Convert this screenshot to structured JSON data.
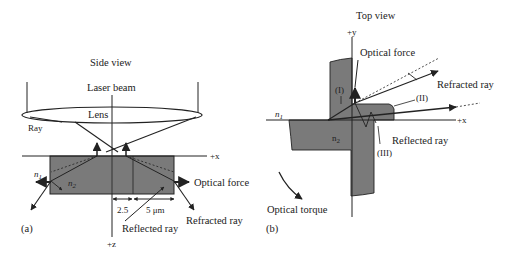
{
  "figure": {
    "panel_a": {
      "title": "Side view",
      "caption_tag": "(a)",
      "labels": {
        "laser_beam": "Laser beam",
        "lens": "Lens",
        "ray": "Ray",
        "x_axis": "+x",
        "z_axis": "+z",
        "n1": "n",
        "n1_sub": "1",
        "n2": "n",
        "n2_sub": "2",
        "optical_force": "Optical force",
        "refracted_ray": "Refracted ray",
        "reflected_ray": "Reflected ray",
        "dim_small": "2.5",
        "dim_large": "5 μm"
      }
    },
    "panel_b": {
      "title": "Top view",
      "caption_tag": "(b)",
      "labels": {
        "y_axis": "+y",
        "x_axis": "+x",
        "optical_force": "Optical force",
        "refracted_ray": "Refracted ray",
        "reflected_ray": "Reflected ray",
        "region_1": "(I)",
        "region_2": "(II)",
        "region_3": "(III)",
        "n1": "n",
        "n1_sub": "1",
        "n2": "n",
        "n2_sub": "2",
        "optical_torque": "Optical torque"
      }
    },
    "colors": {
      "block_fill": "#7a7a7a",
      "stroke": "#222222",
      "background": "#ffffff"
    }
  }
}
